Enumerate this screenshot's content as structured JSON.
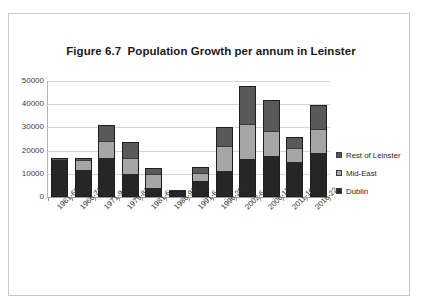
{
  "figure": {
    "title": "Figure 6.7  Population Growth per annum in Leinster"
  },
  "legend": {
    "position": "right",
    "items": [
      {
        "label": "Rest of Leinster",
        "color": "#595959",
        "icon": "square-swatch-icon"
      },
      {
        "label": "Mid-East",
        "color": "#a6a6a6",
        "icon": "square-swatch-icon"
      },
      {
        "label": "Dublin",
        "color": "#262626",
        "icon": "square-swatch-icon"
      }
    ]
  },
  "chart_data": {
    "type": "bar",
    "stacked": true,
    "title": "Figure 6.7  Population Growth per annum in Leinster",
    "xlabel": "",
    "ylabel": "",
    "ylim": [
      0,
      50000
    ],
    "yticks": [
      0,
      10000,
      20000,
      30000,
      40000,
      50000
    ],
    "ytick_labels": [
      "0",
      "10000",
      "20000",
      "30000",
      "40000",
      "50000"
    ],
    "grid": true,
    "legend_position": "right",
    "categories": [
      "1961-66",
      "1966-71",
      "1971-9",
      "1979-81",
      "1981-6",
      "1986-91",
      "1991-6",
      "1996-2002",
      "2002-6",
      "2006-11",
      "2011-16",
      "2016-22"
    ],
    "series": [
      {
        "name": "Dublin",
        "color": "#262626",
        "values": [
          15800,
          11700,
          16700,
          10000,
          4000,
          2000,
          7000,
          11000,
          16500,
          17500,
          15000,
          18800
        ]
      },
      {
        "name": "Mid-East",
        "color": "#a6a6a6",
        "values": [
          100,
          4200,
          7500,
          7000,
          6000,
          500,
          3500,
          10800,
          15000,
          10800,
          6000,
          10600
        ]
      },
      {
        "name": "Rest of Leinster",
        "color": "#595959",
        "values": [
          800,
          1100,
          6700,
          6500,
          2500,
          300,
          2500,
          8500,
          16300,
          13700,
          5000,
          10300
        ]
      }
    ],
    "totals": [
      16700,
      17000,
      30900,
      23500,
      12500,
      2800,
      13000,
      30300,
      47800,
      42000,
      26000,
      39700
    ]
  }
}
